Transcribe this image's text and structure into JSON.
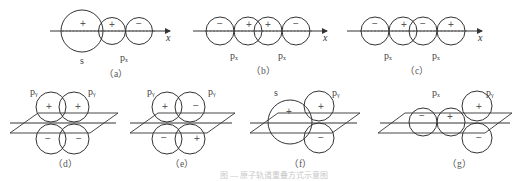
{
  "figure": {
    "panels": [
      {
        "id": "a",
        "caption": "（a）",
        "axis_label": "x",
        "orbitals": [
          {
            "label": "s",
            "sign": "+"
          },
          {
            "label": "pₓ",
            "signs": [
              "+",
              "−"
            ]
          }
        ]
      },
      {
        "id": "b",
        "caption": "（b）",
        "axis_label": "x",
        "orbitals": [
          {
            "label": "pₓ",
            "signs": [
              "−",
              "+"
            ]
          },
          {
            "label": "pₓ",
            "signs": [
              "+",
              "−"
            ]
          }
        ]
      },
      {
        "id": "c",
        "caption": "（c）",
        "axis_label": "x",
        "orbitals": [
          {
            "label": "pₓ",
            "signs": [
              "−",
              "+"
            ]
          },
          {
            "label": "pₓ",
            "signs": [
              "−",
              "+"
            ]
          }
        ]
      },
      {
        "id": "d",
        "caption": "（d）",
        "orbitals": [
          {
            "label": "pᵧ",
            "signs": [
              "+",
              "−"
            ]
          },
          {
            "label": "pᵧ",
            "signs": [
              "+",
              "−"
            ]
          }
        ]
      },
      {
        "id": "e",
        "caption": "（e）",
        "orbitals": [
          {
            "label": "pᵧ",
            "signs": [
              "+",
              "−"
            ]
          },
          {
            "label": "pᵧ",
            "signs": [
              "−",
              "+"
            ]
          }
        ]
      },
      {
        "id": "f",
        "caption": "（f）",
        "orbitals": [
          {
            "label": "s",
            "sign": "+"
          },
          {
            "label": "pᵧ",
            "signs": [
              "+",
              "−"
            ]
          }
        ]
      },
      {
        "id": "g",
        "caption": "（g）",
        "orbitals": [
          {
            "label": "pₓ",
            "signs": [
              "−",
              "+"
            ]
          },
          {
            "label": "pᵧ",
            "signs": [
              "+",
              "−"
            ]
          }
        ]
      }
    ],
    "figure_caption": "图 — 原子轨道重叠方式示意图"
  }
}
